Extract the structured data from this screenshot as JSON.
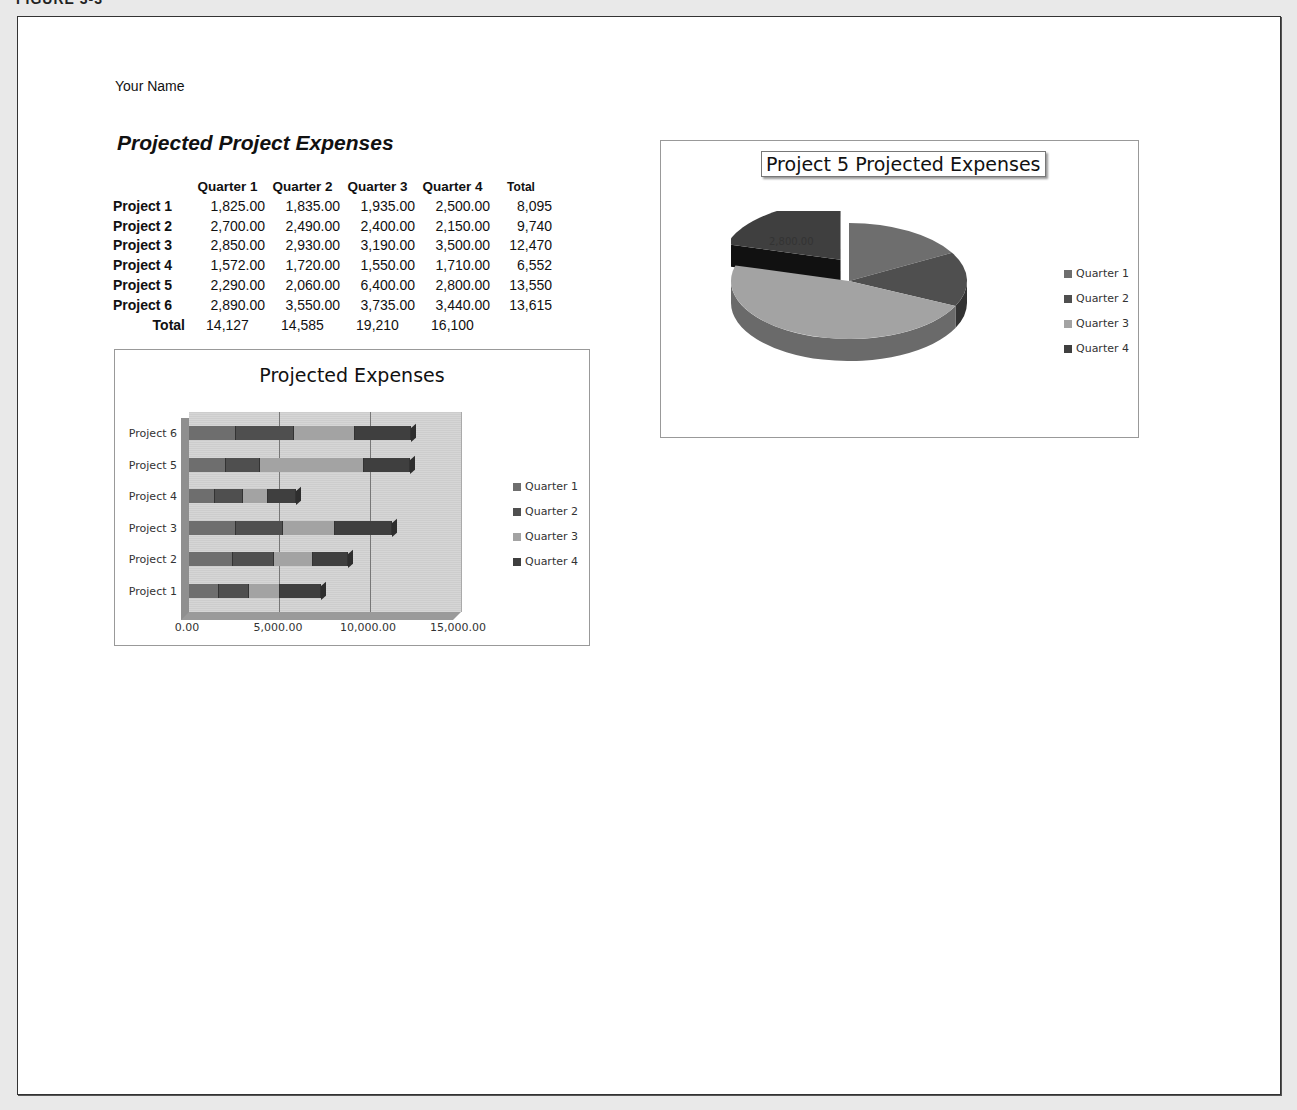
{
  "figure_label": "FIGURE 3-3",
  "page": {
    "your_name": "Your Name",
    "sheet_title": "Projected Project Expenses"
  },
  "table": {
    "headers": [
      "",
      "Quarter 1",
      "Quarter 2",
      "Quarter 3",
      "Quarter 4",
      "Total"
    ],
    "rows": [
      {
        "label": "Project 1",
        "q1": "1,825.00",
        "q2": "1,835.00",
        "q3": "1,935.00",
        "q4": "2,500.00",
        "total": "8,095"
      },
      {
        "label": "Project 2",
        "q1": "2,700.00",
        "q2": "2,490.00",
        "q3": "2,400.00",
        "q4": "2,150.00",
        "total": "9,740"
      },
      {
        "label": "Project 3",
        "q1": "2,850.00",
        "q2": "2,930.00",
        "q3": "3,190.00",
        "q4": "3,500.00",
        "total": "12,470"
      },
      {
        "label": "Project 4",
        "q1": "1,572.00",
        "q2": "1,720.00",
        "q3": "1,550.00",
        "q4": "1,710.00",
        "total": "6,552"
      },
      {
        "label": "Project 5",
        "q1": "2,290.00",
        "q2": "2,060.00",
        "q3": "6,400.00",
        "q4": "2,800.00",
        "total": "13,550"
      },
      {
        "label": "Project 6",
        "q1": "2,890.00",
        "q2": "3,550.00",
        "q3": "3,735.00",
        "q4": "3,440.00",
        "total": "13,615"
      }
    ],
    "totals": {
      "label": "Total",
      "q1": "14,127",
      "q2": "14,585",
      "q3": "19,210",
      "q4": "16,100"
    }
  },
  "colors": {
    "quarter_1": "#6e6e6e",
    "quarter_2": "#4f4f4f",
    "quarter_3": "#a3a3a3",
    "quarter_4": "#3f3f3f"
  },
  "chart_data": [
    {
      "type": "bar",
      "orientation": "horizontal-stacked-3d",
      "title": "Projected Expenses",
      "categories": [
        "Project 1",
        "Project 2",
        "Project 3",
        "Project 4",
        "Project 5",
        "Project 6"
      ],
      "series": [
        {
          "name": "Quarter 1",
          "values": [
            1825,
            2700,
            2850,
            1572,
            2290,
            2890
          ]
        },
        {
          "name": "Quarter 2",
          "values": [
            1835,
            2490,
            2930,
            1720,
            2060,
            3550
          ]
        },
        {
          "name": "Quarter 3",
          "values": [
            1935,
            2400,
            3190,
            1550,
            6400,
            3735
          ]
        },
        {
          "name": "Quarter 4",
          "values": [
            2500,
            2150,
            3500,
            1710,
            2800,
            3440
          ]
        }
      ],
      "xticks": [
        "0.00",
        "5,000.00",
        "10,000.00",
        "15,000.00"
      ],
      "xlim": [
        0,
        15000
      ],
      "xlabel": "",
      "ylabel": "",
      "grid": true,
      "legend_position": "right"
    },
    {
      "type": "pie",
      "style": "3d-exploded",
      "title": "Project 5 Projected Expenses",
      "categories": [
        "Quarter 1",
        "Quarter 2",
        "Quarter 3",
        "Quarter 4"
      ],
      "values": [
        2290,
        2060,
        6400,
        2800
      ],
      "data_labels": [
        {
          "category": "Quarter 4",
          "text": "2,800.00"
        }
      ],
      "exploded": "Quarter 4",
      "legend_position": "right"
    }
  ],
  "bar_chart": {
    "title": "Projected Expenses",
    "ylabels": [
      "Project 6",
      "Project 5",
      "Project 4",
      "Project 3",
      "Project 2",
      "Project 1"
    ],
    "xticks": [
      "0.00",
      "5,000.00",
      "10,000.00",
      "15,000.00"
    ],
    "legend": [
      "Quarter 1",
      "Quarter 2",
      "Quarter 3",
      "Quarter 4"
    ]
  },
  "pie_chart": {
    "title": "Project 5 Projected Expenses",
    "data_label": "2,800.00",
    "legend": [
      "Quarter 1",
      "Quarter 2",
      "Quarter 3",
      "Quarter 4"
    ]
  }
}
